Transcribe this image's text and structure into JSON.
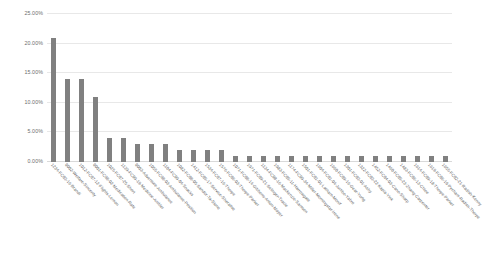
{
  "chart_data": {
    "type": "bar",
    "title": "",
    "subtitle": "",
    "xlabel": "",
    "ylabel": "",
    "ylim": [
      0,
      25
    ],
    "ytick_labels": [
      "0.00%",
      "5.00%",
      "10.00%",
      "15.00%",
      "20.00%",
      "25.00%"
    ],
    "ytick_values": [
      0,
      5,
      10,
      15,
      20,
      25
    ],
    "grid": true,
    "legend": null,
    "legend_position": "none",
    "bar_color": "#808080",
    "gridline_color": "#e8e8e8",
    "axis_text_color": "#6d6d6d",
    "background_color": "#ffffff",
    "value_suffix": "%",
    "categories": [
      "1234-FC03-16-Brandi",
      "0002-Welfare-Sincerity",
      "1012-FC07-12-Flights-Lemon",
      "0001-FC98-02-Medication-Rate",
      "1025-FC07-25-Short",
      "1139-FC09-19-Medicine-Ambler",
      "0003-Adventure-Ambulance",
      "1055-FC98-03-Ambulance-Position",
      "1104-FC09-04-Snacks",
      "1082-FC08-05-Sandor-Ta-Stone",
      "1412-FC05-17-Service-Sherative",
      "1534-FC07-16-Thorpe",
      "1576-FC06-03-Thorpe-Parker",
      "1071-FC08-14-Gibbons-Anton-Mayer",
      "1971-FC09-21-Selinger-Tracie",
      "1134-FC08-16-Mackenzie-Samson",
      "1983-FC05-11-Harrowgate",
      "1174-FC09-34-Miller-Morningstar-Irene",
      "1501-FC01-01-Latham-Monif",
      "1604-FC01-04-Jumbo-Yabro",
      "1660-FC09-16-Gear-Yurtg",
      "1301-FC03-01-Ashy",
      "1322-FC03-22-Kapia-Yink",
      "1452-FC04-03-Cano-Sharp",
      "1460-FC05-23-Zhang-Carpenter",
      "1483-FC06-13-Chloe",
      "1614-FC09-18-Thorpe-Parker",
      "1619-FC06-19-Pycham-Radish-Thorpe",
      "1655-FC02-21-Radish-Kenny"
    ],
    "values": [
      21,
      14,
      14,
      11,
      4,
      4,
      3,
      3,
      3,
      2,
      2,
      2,
      2,
      1,
      1,
      1,
      1,
      1,
      1,
      1,
      1,
      1,
      1,
      1,
      1,
      1,
      1,
      1,
      1
    ]
  }
}
